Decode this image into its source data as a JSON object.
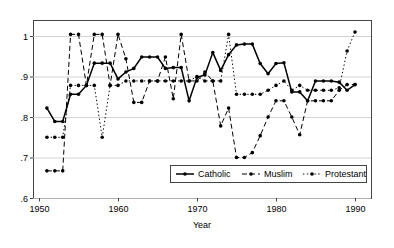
{
  "chart_data": {
    "type": "line",
    "title": "",
    "xlabel": "Year",
    "ylabel": "",
    "xlim": [
      1950,
      1991
    ],
    "ylim": [
      0.6,
      1.02
    ],
    "xticks": [
      1950,
      1960,
      1970,
      1980,
      1990
    ],
    "xtick_labels": [
      "1950",
      "1960",
      "1970",
      "1980",
      "1990"
    ],
    "yticks": [
      0.6,
      0.7,
      0.8,
      0.9,
      1.0
    ],
    "ytick_labels": [
      ".6",
      ".7",
      ".8",
      ".9",
      "1"
    ],
    "grid": true,
    "grid_axis": "y",
    "legend_position": "lower right",
    "series": [
      {
        "name": "Catholic",
        "style": "solid",
        "color": "#000000",
        "marker": "circle",
        "x": [
          1951,
          1952,
          1953,
          1954,
          1955,
          1956,
          1957,
          1958,
          1959,
          1960,
          1961,
          1962,
          1963,
          1964,
          1965,
          1966,
          1967,
          1968,
          1969,
          1970,
          1971,
          1972,
          1973,
          1974,
          1975,
          1976,
          1977,
          1978,
          1979,
          1980,
          1981,
          1982,
          1983,
          1984,
          1985,
          1986,
          1987,
          1988,
          1989,
          1990
        ],
        "y": [
          0.822,
          0.789,
          0.789,
          0.856,
          0.856,
          0.878,
          0.933,
          0.933,
          0.933,
          0.894,
          0.911,
          0.92,
          0.948,
          0.948,
          0.948,
          0.92,
          0.922,
          0.922,
          0.84,
          0.898,
          0.904,
          0.959,
          0.915,
          0.954,
          0.978,
          0.98,
          0.98,
          0.932,
          0.907,
          0.932,
          0.934,
          0.862,
          0.862,
          0.84,
          0.889,
          0.889,
          0.889,
          0.886,
          0.866,
          0.88
        ]
      },
      {
        "name": "Muslim",
        "style": "dashed",
        "color": "#000000",
        "marker": "circle",
        "x": [
          1951,
          1952,
          1953,
          1954,
          1955,
          1956,
          1957,
          1958,
          1959,
          1960,
          1961,
          1962,
          1963,
          1964,
          1965,
          1966,
          1967,
          1968,
          1969,
          1970,
          1971,
          1972,
          1973,
          1974,
          1975,
          1976,
          1977,
          1978,
          1979,
          1980,
          1981,
          1982,
          1983,
          1984,
          1985,
          1986,
          1987,
          1988,
          1989,
          1990
        ],
        "y": [
          0.667,
          0.667,
          0.667,
          1.004,
          1.004,
          0.878,
          1.004,
          1.004,
          0.878,
          1.004,
          0.944,
          0.836,
          0.836,
          0.889,
          0.889,
          0.948,
          0.845,
          1.004,
          0.889,
          0.889,
          0.911,
          0.889,
          0.778,
          0.822,
          0.7,
          0.7,
          0.712,
          0.754,
          0.8,
          0.84,
          0.84,
          0.8,
          0.756,
          0.84,
          0.84,
          0.84,
          0.84,
          0.866,
          0.88,
          0.88
        ]
      },
      {
        "name": "Protestant",
        "style": "dotted",
        "color": "#000000",
        "marker": "circle",
        "x": [
          1951,
          1952,
          1953,
          1954,
          1955,
          1956,
          1957,
          1958,
          1959,
          1960,
          1961,
          1962,
          1963,
          1964,
          1965,
          1966,
          1967,
          1968,
          1969,
          1970,
          1971,
          1972,
          1973,
          1974,
          1975,
          1976,
          1977,
          1978,
          1979,
          1980,
          1981,
          1982,
          1983,
          1984,
          1985,
          1986,
          1987,
          1988,
          1989,
          1990
        ],
        "y": [
          0.75,
          0.75,
          0.75,
          0.878,
          0.878,
          0.878,
          0.878,
          0.75,
          0.878,
          0.878,
          0.889,
          0.889,
          0.889,
          0.889,
          0.889,
          0.889,
          0.889,
          0.889,
          0.889,
          0.9,
          0.889,
          0.889,
          0.889,
          1.004,
          0.856,
          0.856,
          0.856,
          0.856,
          0.866,
          0.878,
          0.889,
          0.866,
          0.878,
          0.866,
          0.866,
          0.866,
          0.866,
          0.872,
          0.963,
          1.01
        ]
      }
    ],
    "legend": [
      {
        "label": "Catholic",
        "style": "solid"
      },
      {
        "label": "Muslim",
        "style": "dashed"
      },
      {
        "label": "Protestant",
        "style": "dotted"
      }
    ]
  }
}
